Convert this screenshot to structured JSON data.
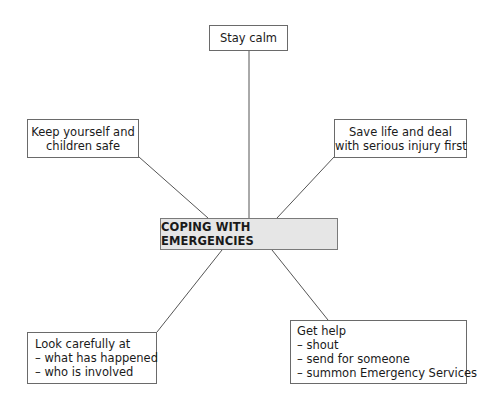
{
  "diagram": {
    "center": {
      "label": "COPING WITH EMERGENCIES"
    },
    "nodes": [
      {
        "id": "stay-calm",
        "lines": [
          "Stay calm"
        ]
      },
      {
        "id": "keep-safe",
        "lines": [
          "Keep yourself and",
          "children safe"
        ]
      },
      {
        "id": "save-life",
        "lines": [
          "Save life and deal",
          "with serious injury first"
        ]
      },
      {
        "id": "look-carefully",
        "lines": [
          "Look carefully at",
          "– what has happened",
          "– who is involved"
        ]
      },
      {
        "id": "get-help",
        "lines": [
          "Get help",
          "– shout",
          "– send for someone",
          "– summon Emergency Services"
        ]
      }
    ],
    "colors": {
      "center_fill": "#e6e6e6",
      "border": "#6a6a6a",
      "connector": "#555555"
    }
  }
}
